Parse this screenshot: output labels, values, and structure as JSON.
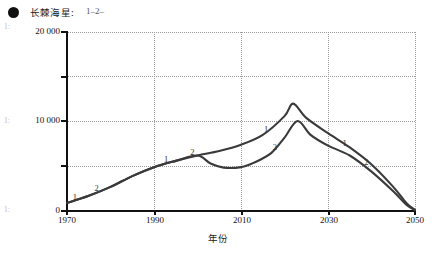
{
  "legend": {
    "marker": "filled-circle",
    "title": "长棘海星:",
    "keys": "1–2–"
  },
  "margin_marks": [
    "1:",
    "1:",
    "1:"
  ],
  "axes": {
    "x_title": "年份",
    "y_title": "",
    "x_ticks": [
      "1970",
      "1990",
      "2010",
      "2030",
      "2050"
    ],
    "y_ticks": [
      "0",
      "10 000",
      "20 000"
    ]
  },
  "series_labels": {
    "one": "1",
    "two": "2"
  },
  "chart_data": {
    "type": "line",
    "title": "长棘海星:",
    "xlabel": "年份",
    "ylabel": "",
    "xlim": [
      1970,
      2050
    ],
    "ylim": [
      0,
      20000
    ],
    "x_ticks": [
      1970,
      1990,
      2010,
      2030,
      2050
    ],
    "y_ticks": [
      0,
      5000,
      10000,
      15000,
      20000
    ],
    "y_tick_labels": [
      "0",
      "",
      "10 000",
      "",
      "20 000"
    ],
    "grid": "dotted-both",
    "legend_position": "top-left",
    "series": [
      {
        "name": "1",
        "x": [
          1970,
          1975,
          1980,
          1985,
          1990,
          1995,
          2000,
          2005,
          2010,
          2015,
          2020,
          2022,
          2025,
          2030,
          2035,
          2040,
          2045,
          2048,
          2050
        ],
        "values": [
          900,
          1700,
          2700,
          3900,
          4900,
          5600,
          6200,
          6700,
          7400,
          8500,
          10600,
          12000,
          10400,
          8700,
          7100,
          5200,
          2700,
          900,
          100
        ]
      },
      {
        "name": "2",
        "x": [
          1970,
          1975,
          1980,
          1985,
          1990,
          1995,
          2000,
          2003,
          2006,
          2010,
          2013,
          2017,
          2020,
          2023,
          2026,
          2030,
          2035,
          2040,
          2045,
          2048,
          2050
        ],
        "values": [
          900,
          1700,
          2700,
          3900,
          4900,
          5600,
          6200,
          5300,
          4850,
          4900,
          5400,
          6500,
          8200,
          10050,
          8500,
          7300,
          6200,
          4400,
          2200,
          700,
          100
        ]
      }
    ],
    "annotations": [
      {
        "label": "1",
        "x": 1972,
        "y": 1000
      },
      {
        "label": "2",
        "x": 1977,
        "y": 2000
      },
      {
        "label": "1",
        "x": 1993,
        "y": 5250
      },
      {
        "label": "2",
        "x": 1999,
        "y": 6000
      },
      {
        "label": "1",
        "x": 2016,
        "y": 8650
      },
      {
        "label": "2",
        "x": 2018,
        "y": 6600
      },
      {
        "label": "1",
        "x": 2034,
        "y": 7050
      },
      {
        "label": "2",
        "x": 2039,
        "y": 4900
      }
    ]
  }
}
